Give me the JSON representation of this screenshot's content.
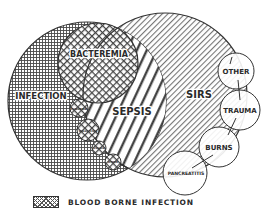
{
  "diagram": {
    "type": "venn",
    "sets": {
      "infection": {
        "label": "INFECTION",
        "pattern": "grid crosshatch"
      },
      "sirs": {
        "label": "SIRS",
        "pattern": "thin diagonal stripes"
      },
      "sepsis": {
        "label": "SEPSIS",
        "pattern": "bold diagonal stripes",
        "note": "intersection of infection and SIRS"
      },
      "bacteremia": {
        "label": "BACTEREMIA",
        "pattern": "diamond crosshatch"
      }
    },
    "blood_borne_circles": [
      {
        "label": "FUNGEMIA"
      },
      {
        "label": "PARASITEMIA"
      },
      {
        "label": "VIREMIA"
      },
      {
        "label": "OTHER"
      }
    ],
    "sirs_causes": [
      {
        "label": "OTHER"
      },
      {
        "label": "TRAUMA"
      },
      {
        "label": "BURNS"
      },
      {
        "label": "PANCREATITIS"
      }
    ],
    "legend": {
      "label": "BLOOD BORNE INFECTION",
      "icon": "crosshatch-swatch"
    },
    "colors": {
      "ink": "#2a2a2a",
      "background": "#ffffff"
    }
  }
}
